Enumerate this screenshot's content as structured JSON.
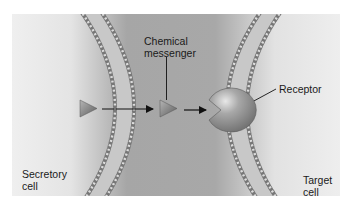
{
  "labels": {
    "chemical_messenger": "Chemical\nmessenger",
    "receptor": "Receptor",
    "secretory_cell": "Secretory\ncell",
    "target_cell": "Target\ncell"
  },
  "colors": {
    "frame_background": "#a9a9a9",
    "cell_interior_light": "#ededed",
    "membrane_outline": "#6e6e6e",
    "messenger": "#8a8a8a",
    "receptor": "#9a9a9a",
    "arrow": "#111111",
    "text": "#1a1a1a"
  },
  "elements": {
    "messengers": [
      {
        "id": "messenger-in-secretory-cell",
        "x": 88,
        "y": 108
      },
      {
        "id": "messenger-in-extracellular-space",
        "x": 168,
        "y": 108
      }
    ],
    "arrows": [
      {
        "id": "arrow-secretion",
        "from": [
          102,
          109
        ],
        "to": [
          154,
          109
        ]
      },
      {
        "id": "arrow-binding",
        "from": [
          184,
          109
        ],
        "to": [
          206,
          109
        ]
      }
    ]
  }
}
